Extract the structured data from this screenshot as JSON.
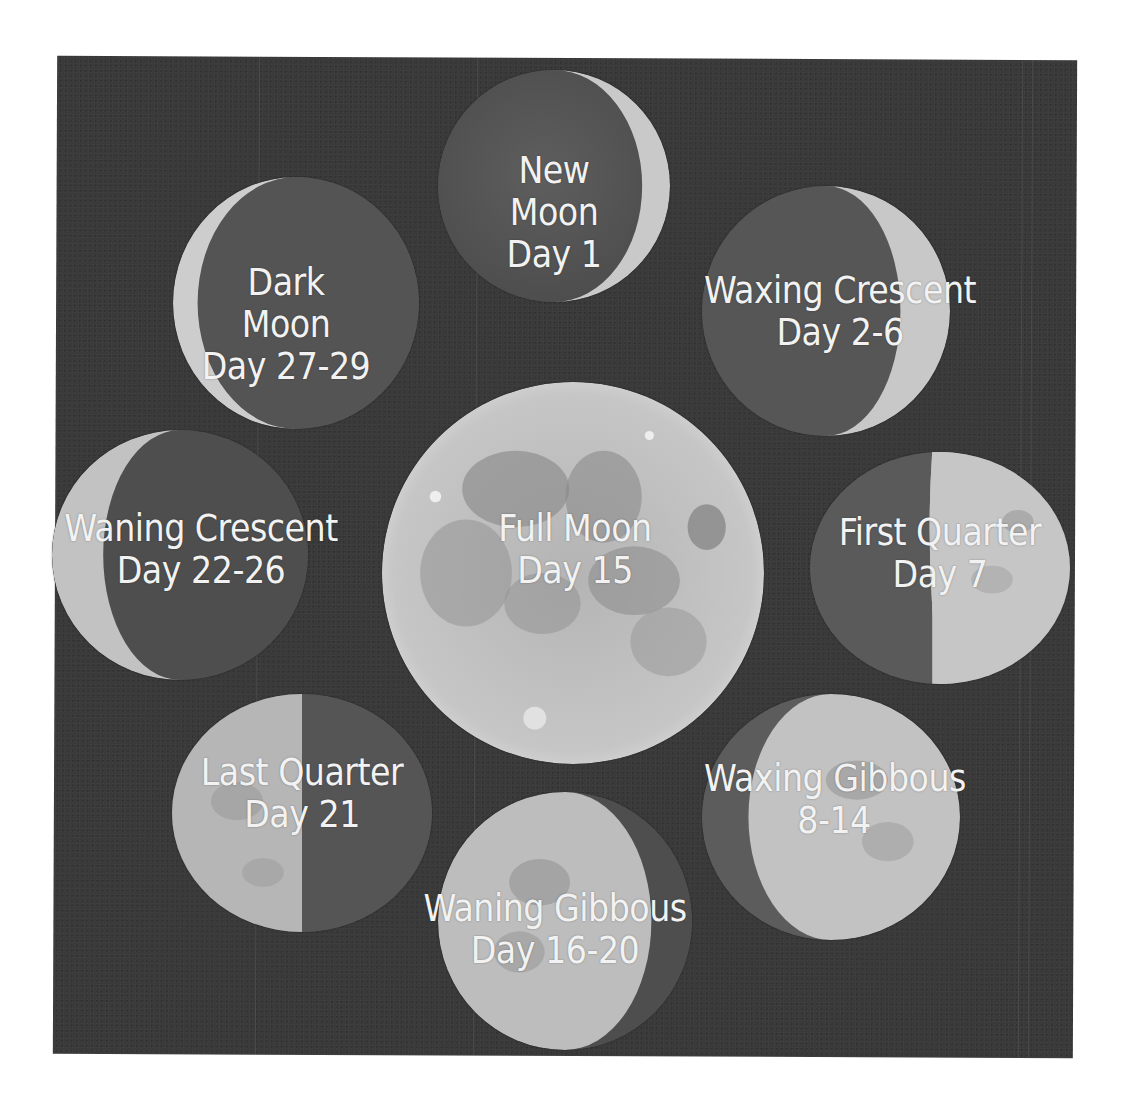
{
  "colors": {
    "panel_bg": "#3a3a3a",
    "label_text": "#f2f2f2",
    "moon_lit": "#c9c9c9",
    "moon_dark": "#555555",
    "moon_mare": "#8d8d8d"
  },
  "phases": [
    {
      "id": "new-moon",
      "lines": [
        "New",
        "Moon",
        "Day 1"
      ],
      "lit": "crescent-right-thin"
    },
    {
      "id": "waxing-crescent",
      "lines": [
        "Waxing Crescent",
        "Day 2-6"
      ],
      "lit": "crescent-right"
    },
    {
      "id": "first-quarter",
      "lines": [
        "First Quarter",
        "Day 7"
      ],
      "lit": "half-right"
    },
    {
      "id": "waxing-gibbous",
      "lines": [
        "Waxing Gibbous",
        "8-14"
      ],
      "lit": "gibbous-right"
    },
    {
      "id": "full-moon",
      "lines": [
        "Full Moon",
        "Day 15"
      ],
      "lit": "full"
    },
    {
      "id": "waning-gibbous",
      "lines": [
        "Waning Gibbous",
        "Day 16-20"
      ],
      "lit": "gibbous-left"
    },
    {
      "id": "last-quarter",
      "lines": [
        "Last Quarter",
        "Day 21"
      ],
      "lit": "half-left"
    },
    {
      "id": "waning-crescent",
      "lines": [
        "Waning Crescent",
        "Day 22-26"
      ],
      "lit": "crescent-left"
    },
    {
      "id": "dark-moon",
      "lines": [
        "Dark",
        "Moon",
        "Day 27-29"
      ],
      "lit": "crescent-left-thin"
    }
  ]
}
